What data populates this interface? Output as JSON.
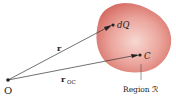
{
  "diagram": {
    "origin": {
      "label": "O"
    },
    "vector_r": {
      "label": "r"
    },
    "vector_roc": {
      "label": "r",
      "subscript": "OC"
    },
    "point_dq": {
      "label": "dQ"
    },
    "point_c": {
      "label": "C"
    },
    "region": {
      "label": "Region ℛ"
    },
    "colors": {
      "region_fill_outer": "#d9706a",
      "region_fill_inner": "#f6d2cc",
      "line": "#333333",
      "text": "#222222"
    }
  }
}
